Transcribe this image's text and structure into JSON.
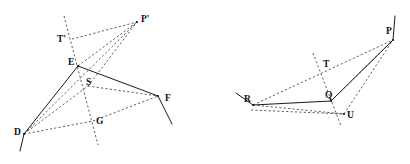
{
  "figure": {
    "background_color": "#ffffff",
    "ink_color": "#1b1b1b",
    "width": 410,
    "height": 164,
    "diagrams": [
      {
        "id": "left-diagram",
        "name": "Polygon D-E-F with projection point P-prime",
        "points": {
          "D": {
            "label": "D",
            "x": 24,
            "y": 134,
            "label_x": 14,
            "label_y": 133
          },
          "E": {
            "label": "E",
            "x": 78,
            "y": 66,
            "label_x": 68,
            "label_y": 63
          },
          "F": {
            "label": "F",
            "x": 158,
            "y": 96,
            "label_x": 165,
            "label_y": 99
          },
          "S": {
            "label": "S",
            "x": 88,
            "y": 86,
            "label_x": 86,
            "label_y": 83
          },
          "G": {
            "label": "G",
            "x": 93,
            "y": 121,
            "label_x": 96,
            "label_y": 122
          },
          "T'": {
            "label": "T'",
            "x": 72,
            "y": 39,
            "label_x": 57,
            "label_y": 40
          },
          "P'": {
            "label": "P'",
            "x": 137,
            "y": 22,
            "label_x": 141,
            "label_y": 20
          }
        },
        "solid_paths": [
          "M 20 151 L 24 134 L 78 66 L 158 96 L 172 124",
          "M 78 66 L 158 96"
        ],
        "dashed_paths": [
          "M 24 134 L 137 22",
          "M 78 66 L 137 22",
          "M 88 86 L 137 22",
          "M 24 134 L 88 86",
          "M 24 134 L 93 121",
          "M 93 121 L 158 96",
          "M 88 86 L 158 96",
          "M 64 16 L 98 145",
          "M 72 39 L 137 22"
        ]
      },
      {
        "id": "right-diagram",
        "name": "Polygon R-Q-P with point U and T",
        "points": {
          "R": {
            "label": "R",
            "x": 253,
            "y": 105,
            "label_x": 246,
            "label_y": 100
          },
          "Q": {
            "label": "Q",
            "x": 331,
            "y": 101,
            "label_x": 326,
            "label_y": 97
          },
          "U": {
            "label": "U",
            "x": 344,
            "y": 114,
            "label_x": 347,
            "label_y": 115
          },
          "T": {
            "label": "T",
            "x": 327,
            "y": 68,
            "label_x": 325,
            "label_y": 65
          },
          "P": {
            "label": "P",
            "x": 393,
            "y": 40,
            "label_x": 388,
            "label_y": 33
          }
        },
        "solid_paths": [
          "M 236 93 L 253 105 L 331 101 L 393 40 L 395 16"
        ],
        "dashed_paths": [
          "M 253 105 L 393 40",
          "M 331 101 L 393 40",
          "M 344 114 L 393 40",
          "M 253 110 L 344 114",
          "M 344 114 L 393 40",
          "M 313 53 L 340 124",
          "M 253 105 L 344 114"
        ]
      }
    ]
  }
}
